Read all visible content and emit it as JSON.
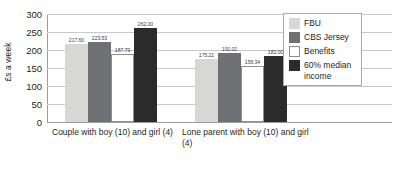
{
  "chart_data": {
    "type": "bar",
    "title": "",
    "xlabel": "",
    "ylabel": "£s a week",
    "ylim": [
      0,
      300
    ],
    "yticks": [
      0,
      50,
      100,
      150,
      200,
      250,
      300
    ],
    "ytick_labels": [
      "0",
      "50",
      "100",
      "150",
      "200",
      "250",
      "300"
    ],
    "grid": true,
    "legend_position": "top-right",
    "categories": [
      "Couple with boy (10) and girl (4)",
      "Lone parent with boy (10) and girl (4)"
    ],
    "series": [
      {
        "name": "FBU",
        "color": "#d7d8d6",
        "values": [
          217.6,
          175.21
        ],
        "labels": [
          "217.60",
          "175.21"
        ]
      },
      {
        "name": "CBS Jersey",
        "color": "#6e7073",
        "values": [
          223.53,
          191.02
        ],
        "labels": [
          "223.53",
          "191.02"
        ]
      },
      {
        "name": "Benefits",
        "color": "#ffffff",
        "values": [
          187.79,
          156.34
        ],
        "labels": [
          "187.79",
          "156.34"
        ]
      },
      {
        "name": "60% median income",
        "color": "#2b2b2b",
        "values": [
          262.0,
          182.0
        ],
        "labels": [
          "262.00",
          "182.00"
        ]
      }
    ]
  },
  "legend": {
    "items": [
      {
        "label": "FBU"
      },
      {
        "label": "CBS Jersey"
      },
      {
        "label": "Benefits"
      },
      {
        "label": "60% median income"
      }
    ]
  }
}
